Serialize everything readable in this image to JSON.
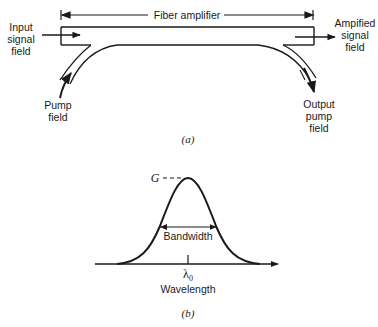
{
  "part_a": {
    "caption": "(a)",
    "fiber_amplifier_label": "Fiber amplifier",
    "input_signal": [
      "Input",
      "signal",
      "field"
    ],
    "amplified_signal": [
      "Ampified",
      "signal",
      "field"
    ],
    "pump_field": [
      "Pump",
      "field"
    ],
    "output_pump": [
      "Output",
      "pump",
      "field"
    ]
  },
  "part_b": {
    "caption": "(b)",
    "gain_label": "G",
    "bandwidth_label": "Bandwidth",
    "center_wavelength_label": "λ0",
    "center_wavelength_symbol": "λ",
    "center_wavelength_subscript": "0",
    "x_axis_label": "Wavelength"
  },
  "colors": {
    "line": "#1a1a1a",
    "background": "#ffffff"
  }
}
